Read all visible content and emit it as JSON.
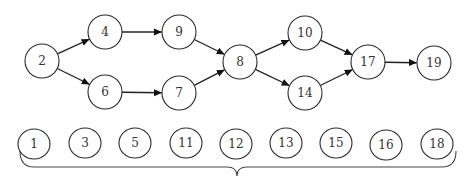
{
  "diagram": {
    "type": "directed-graph",
    "colors": {
      "stroke": "#2a2a2a",
      "text": "#333333",
      "background": "#ffffff"
    },
    "nodes": [
      {
        "id": "2",
        "label": "2",
        "x": 42,
        "y": 61
      },
      {
        "id": "4",
        "label": "4",
        "x": 105,
        "y": 32
      },
      {
        "id": "6",
        "label": "6",
        "x": 105,
        "y": 92
      },
      {
        "id": "9",
        "label": "9",
        "x": 179,
        "y": 32
      },
      {
        "id": "7",
        "label": "7",
        "x": 179,
        "y": 93
      },
      {
        "id": "8",
        "label": "8",
        "x": 240,
        "y": 62
      },
      {
        "id": "10",
        "label": "10",
        "x": 305,
        "y": 33
      },
      {
        "id": "14",
        "label": "14",
        "x": 305,
        "y": 93
      },
      {
        "id": "17",
        "label": "17",
        "x": 368,
        "y": 62
      },
      {
        "id": "19",
        "label": "19",
        "x": 434,
        "y": 63
      }
    ],
    "edges": [
      {
        "from": "2",
        "to": "4"
      },
      {
        "from": "2",
        "to": "6"
      },
      {
        "from": "4",
        "to": "9"
      },
      {
        "from": "6",
        "to": "7"
      },
      {
        "from": "9",
        "to": "8"
      },
      {
        "from": "7",
        "to": "8"
      },
      {
        "from": "8",
        "to": "10"
      },
      {
        "from": "8",
        "to": "14"
      },
      {
        "from": "10",
        "to": "17"
      },
      {
        "from": "14",
        "to": "17"
      },
      {
        "from": "17",
        "to": "19"
      }
    ],
    "isolated_nodes": [
      {
        "id": "1",
        "label": "1",
        "x": 34,
        "y": 144
      },
      {
        "id": "3",
        "label": "3",
        "x": 85,
        "y": 143
      },
      {
        "id": "5",
        "label": "5",
        "x": 135,
        "y": 143
      },
      {
        "id": "11",
        "label": "11",
        "x": 186,
        "y": 143
      },
      {
        "id": "12",
        "label": "12",
        "x": 236,
        "y": 144
      },
      {
        "id": "13",
        "label": "13",
        "x": 286,
        "y": 143
      },
      {
        "id": "15",
        "label": "15",
        "x": 336,
        "y": 143
      },
      {
        "id": "16",
        "label": "16",
        "x": 386,
        "y": 145
      },
      {
        "id": "18",
        "label": "18",
        "x": 437,
        "y": 144
      }
    ],
    "brace": {
      "x1": 20,
      "x2": 456,
      "y_top": 155,
      "y_mid": 167,
      "tip_x": 237,
      "tip_y": 176
    }
  }
}
